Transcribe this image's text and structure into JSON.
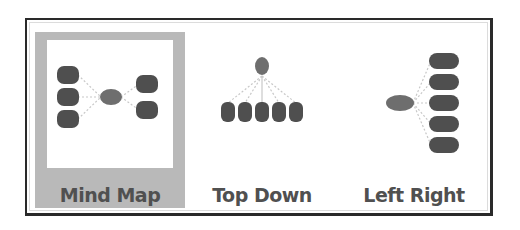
{
  "layout_picker": {
    "selected_index": 0,
    "options": [
      {
        "label": "Mind Map",
        "icon": "mind-map-layout-icon",
        "selected": true
      },
      {
        "label": "Top Down",
        "icon": "top-down-layout-icon",
        "selected": false
      },
      {
        "label": "Left Right",
        "icon": "left-right-layout-icon",
        "selected": false
      }
    ]
  },
  "colors": {
    "selected_background": "#b9b9b9",
    "node_fill": "#4f4f4f",
    "root_fill": "#6e6e6e",
    "label_text": "#505050",
    "border": "#2a2a2a"
  }
}
